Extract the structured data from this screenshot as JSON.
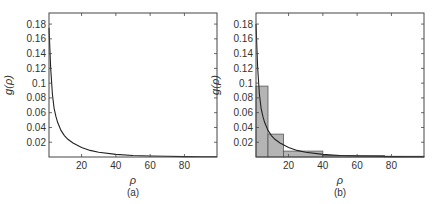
{
  "chart_data": [
    {
      "type": "line",
      "panel_label": "(a)",
      "xlabel": "ρ",
      "ylabel": "g(ρ)",
      "xlim": [
        1,
        99
      ],
      "ylim": [
        0,
        0.195
      ],
      "xticks": [
        20,
        40,
        60,
        80
      ],
      "yticks": [
        0.02,
        0.04,
        0.06,
        0.08,
        0.1,
        0.12,
        0.14,
        0.16,
        0.18
      ],
      "ytick_labels": [
        "0.02",
        "0.04",
        "0.06",
        "0.08",
        "0.1",
        "0.12",
        "0.14",
        "0.16",
        "0.18"
      ],
      "grid": false,
      "series": [
        {
          "name": "g(ρ)",
          "x": [
            1,
            2,
            3,
            4,
            5,
            6,
            8,
            10,
            12,
            15,
            20,
            25,
            30,
            40,
            50,
            60,
            70,
            80,
            90,
            99
          ],
          "values": [
            0.175,
            0.12,
            0.085,
            0.066,
            0.055,
            0.047,
            0.036,
            0.029,
            0.024,
            0.019,
            0.013,
            0.009,
            0.0065,
            0.0035,
            0.002,
            0.0013,
            0.0009,
            0.0006,
            0.0004,
            0.0003
          ]
        }
      ]
    },
    {
      "type": "bar",
      "panel_label": "(b)",
      "xlabel": "ρ",
      "ylabel": "g(ρ)",
      "xlim": [
        1,
        99
      ],
      "ylim": [
        0,
        0.195
      ],
      "xticks": [
        20,
        40,
        60,
        80
      ],
      "yticks": [
        0.02,
        0.04,
        0.06,
        0.08,
        0.1,
        0.12,
        0.14,
        0.16,
        0.18
      ],
      "ytick_labels": [
        "0.02",
        "0.04",
        "0.06",
        "0.08",
        "0.1",
        "0.12",
        "0.14",
        "0.16",
        "0.18"
      ],
      "grid": false,
      "histogram_bins": [
        {
          "x0": 1,
          "x1": 8,
          "value": 0.096
        },
        {
          "x0": 8,
          "x1": 17,
          "value": 0.031
        },
        {
          "x0": 17,
          "x1": 40,
          "value": 0.008
        },
        {
          "x0": 40,
          "x1": 76,
          "value": 0.002
        },
        {
          "x0": 76,
          "x1": 99,
          "value": 0.001
        }
      ],
      "series": [
        {
          "name": "g(ρ)",
          "x": [
            1,
            2,
            3,
            4,
            5,
            6,
            8,
            10,
            12,
            15,
            20,
            25,
            30,
            40,
            50,
            60,
            70,
            80,
            90,
            99
          ],
          "values": [
            0.18,
            0.12,
            0.085,
            0.066,
            0.055,
            0.047,
            0.036,
            0.029,
            0.024,
            0.019,
            0.013,
            0.009,
            0.0065,
            0.0035,
            0.002,
            0.0013,
            0.0009,
            0.0006,
            0.0004,
            0.0003
          ]
        }
      ]
    }
  ],
  "colors": {
    "line": "#222222",
    "bar_fill": "#b4b4b4",
    "bar_edge": "#555555",
    "axis": "#444444"
  }
}
